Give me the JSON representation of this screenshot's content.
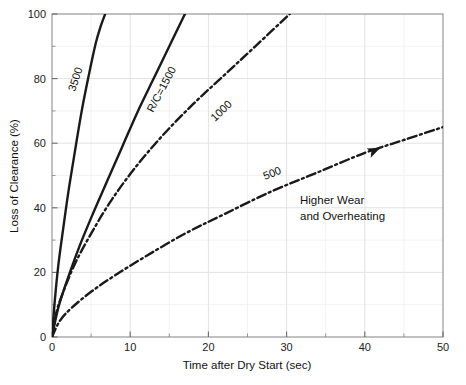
{
  "chart_data": {
    "type": "line",
    "title": "",
    "xlabel": "Time after Dry Start (sec)",
    "ylabel": "Loss of Clearance (%)",
    "xlim": [
      0,
      50
    ],
    "ylim": [
      0,
      100
    ],
    "xticks": [
      0,
      10,
      20,
      30,
      40,
      50
    ],
    "yticks": [
      0,
      20,
      40,
      60,
      80,
      100
    ],
    "xticklabels": [
      "0",
      "10",
      "20",
      "30",
      "40",
      "50"
    ],
    "yticklabels": [
      "0",
      "20",
      "40",
      "60",
      "80",
      "100"
    ],
    "x_minor_ticks": [
      5,
      15,
      25,
      35,
      45
    ],
    "y_minor_ticks": [
      10,
      30,
      50,
      70,
      90
    ],
    "grid": true,
    "grid_color": "#e8e8e8",
    "legend": "none",
    "axis_color": "#9a9a9a",
    "line_color": "#1a1a1a",
    "background": "#ffffff",
    "series": [
      {
        "name": "3500",
        "label": "3500",
        "style": "solid",
        "x": [
          0,
          0.35,
          0.8,
          1.4,
          2.1,
          2.9,
          3.8,
          4.7,
          5.6,
          6.2,
          6.8
        ],
        "values": [
          0,
          11,
          22,
          33,
          45,
          57,
          70,
          81,
          91,
          96,
          100
        ]
      },
      {
        "name": "1500",
        "label": "R/C=1500",
        "style": "solid",
        "x": [
          0,
          0.8,
          2.0,
          3.5,
          5.2,
          7.0,
          9.0,
          11.0,
          13.0,
          15.0,
          17.0
        ],
        "values": [
          0,
          9,
          18,
          28,
          38,
          48,
          59,
          70,
          80,
          90,
          100
        ]
      },
      {
        "name": "1000",
        "label": "1000",
        "style": "dashdot",
        "x": [
          0,
          0.6,
          1.6,
          3.0,
          5.0,
          7.5,
          10.5,
          14.0,
          18.0,
          22.0,
          26.0,
          30.4
        ],
        "values": [
          0,
          8,
          15,
          23,
          32,
          42,
          52,
          62,
          72,
          81,
          90,
          100
        ]
      },
      {
        "name": "500",
        "label": "500",
        "style": "dashdot",
        "x": [
          0,
          1.0,
          2.5,
          5.0,
          8.0,
          12.0,
          17.0,
          22.0,
          28.0,
          34.0,
          40.0,
          45.0,
          50.0
        ],
        "values": [
          0,
          5,
          9,
          14,
          19,
          25,
          32,
          38,
          45,
          51,
          57,
          61,
          65
        ]
      }
    ],
    "annotations": [
      {
        "name": "higher-wear-note",
        "line1": "Higher Wear",
        "line2": "and Overheating",
        "x": 29.5,
        "y": 38
      },
      {
        "name": "trend-arrow",
        "x": 42,
        "y": 58.5
      }
    ]
  }
}
